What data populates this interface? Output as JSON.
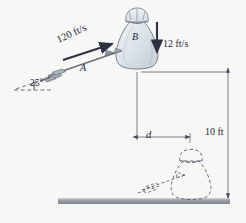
{
  "figure": {
    "background_color": "#f7f7f5",
    "ink_color": "#2d3142",
    "bag_fill_color": "#dde3e8",
    "ground_color": "#9aa0a6"
  },
  "projectile_a": {
    "speed_label": "120 ft/s",
    "body_label": "A",
    "angle_label": "25°",
    "direction": "up-right"
  },
  "body_b": {
    "body_label": "B",
    "speed_label": "12 ft/s",
    "direction": "down"
  },
  "dimensions": {
    "horizontal_label": "d",
    "vertical_label": "10 ft"
  },
  "icons": {
    "arrow_projectile": "arrow-projectile-icon",
    "velocity_vector_a": "velocity-vector-icon",
    "velocity_vector_b": "down-arrow-icon",
    "bag": "bag-icon",
    "ghost_bag": "dashed-bag-icon",
    "ghost_arrow": "dashed-arrow-icon",
    "ground": "ground-line-icon"
  }
}
